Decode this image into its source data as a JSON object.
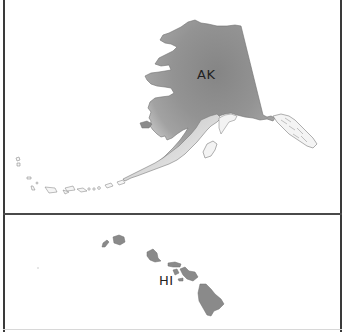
{
  "map": {
    "panels": [
      {
        "id": "alaska",
        "label": "AK",
        "fill_dark": "#8c8c8c",
        "fill_light": "#e6e6e6",
        "outline": "#6e6e6e"
      },
      {
        "id": "hawaii",
        "label": "HI",
        "fill": "#8a8a8a",
        "outline": "#6e6e6e"
      }
    ],
    "colors": {
      "border": "#3a3a3a",
      "background": "#ffffff"
    }
  }
}
